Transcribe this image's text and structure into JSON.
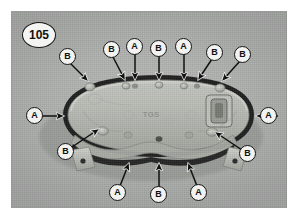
{
  "figure": {
    "number": "105",
    "caption_visible": false
  },
  "photo": {
    "subject": "oval cylinder-head cover gasket assembly",
    "background_color": "#b0b2b0",
    "part_body_color": "#b6b8b4",
    "gasket_seal_color": "#1d1d1d",
    "embossed_text": "TGS"
  },
  "callouts": [
    {
      "id": "c1",
      "label": "B",
      "group": "top",
      "cx": 57,
      "cy": 46,
      "tipx": 79,
      "tipy": 73,
      "style": "diagonal"
    },
    {
      "id": "c2",
      "label": "B",
      "group": "top",
      "cx": 101,
      "cy": 39,
      "tipx": 115,
      "tipy": 73,
      "style": "diagonal"
    },
    {
      "id": "c3",
      "label": "A",
      "group": "top",
      "cx": 124,
      "cy": 36,
      "tipx": 124,
      "tipy": 73,
      "style": "vertical"
    },
    {
      "id": "c4",
      "label": "B",
      "group": "top",
      "cx": 148,
      "cy": 38,
      "tipx": 148,
      "tipy": 73,
      "style": "vertical"
    },
    {
      "id": "c5",
      "label": "A",
      "group": "top",
      "cx": 173,
      "cy": 36,
      "tipx": 173,
      "tipy": 73,
      "style": "vertical"
    },
    {
      "id": "c6",
      "label": "B",
      "group": "top",
      "cx": 204,
      "cy": 42,
      "tipx": 185,
      "tipy": 72,
      "style": "diagonal"
    },
    {
      "id": "c7",
      "label": "B",
      "group": "top",
      "cx": 232,
      "cy": 44,
      "tipx": 208,
      "tipy": 73,
      "style": "diagonal"
    },
    {
      "id": "c8",
      "label": "A",
      "group": "left",
      "cx": 24,
      "cy": 105,
      "tipx": 57,
      "tipy": 105,
      "style": "horizontal"
    },
    {
      "id": "c9",
      "label": "A",
      "group": "right",
      "cx": 274,
      "cy": 105,
      "tipx": 241,
      "tipy": 105,
      "style": "horizontal"
    },
    {
      "id": "c10",
      "label": "B",
      "group": "left",
      "cx": 55,
      "cy": 141,
      "tipx": 90,
      "tipy": 120,
      "style": "diagonal"
    },
    {
      "id": "c11",
      "label": "B",
      "group": "right",
      "cx": 237,
      "cy": 143,
      "tipx": 201,
      "tipy": 122,
      "style": "diagonal"
    },
    {
      "id": "c12",
      "label": "A",
      "group": "bottom",
      "cx": 107,
      "cy": 182,
      "tipx": 117,
      "tipy": 148,
      "style": "diagonal"
    },
    {
      "id": "c13",
      "label": "B",
      "group": "bottom",
      "cx": 148,
      "cy": 184,
      "tipx": 148,
      "tipy": 148,
      "style": "vertical"
    },
    {
      "id": "c14",
      "label": "A",
      "group": "bottom",
      "cx": 188,
      "cy": 182,
      "tipx": 178,
      "tipy": 148,
      "style": "diagonal"
    }
  ],
  "legend": {
    "a_meaning": "A",
    "b_meaning": "B"
  }
}
